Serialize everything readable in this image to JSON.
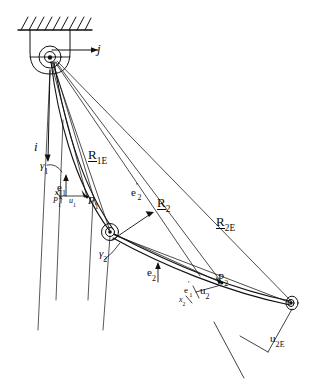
{
  "figure": {
    "type": "line-diagram",
    "width": 311,
    "height": 388,
    "background_color": "#ffffff",
    "stroke_color": "#111111"
  },
  "labels": {
    "j_vector": "j",
    "i_vector": "i",
    "gamma_1": {
      "symbol": "γ",
      "sub": "1"
    },
    "gamma_2": {
      "symbol": "γ",
      "sub": "2"
    },
    "e_1": {
      "symbol": "e",
      "sub": "1"
    },
    "e_2": {
      "symbol": "e",
      "sub": "2"
    },
    "e_1_prime": {
      "symbol": "e",
      "prime": "'",
      "sub": "1"
    },
    "e_2_prime": {
      "symbol": "e",
      "prime": "'",
      "sub": "2"
    },
    "x_1": {
      "symbol": "x",
      "sub": "1"
    },
    "x_2": {
      "symbol": "x",
      "sub": "2"
    },
    "p_1": {
      "symbol": "P",
      "sub": "1"
    },
    "p_2": {
      "symbol": "P",
      "sub": "2"
    },
    "u_1": {
      "symbol": "u",
      "sub": "1"
    },
    "u_2": {
      "symbol": "u",
      "sub": "2"
    },
    "u_2E": {
      "symbol": "u",
      "sub": "2E"
    },
    "R_1E": {
      "symbol": "R",
      "sub": "1E",
      "underlined": true
    },
    "R_2": {
      "symbol": "R",
      "sub": "2",
      "underlined": true
    },
    "R_2E": {
      "symbol": "R",
      "sub": "2E",
      "underlined": true
    }
  },
  "nodes": {
    "base_pivot": {
      "name": "base-hub",
      "x": 50,
      "y": 58
    },
    "mid_joint": {
      "name": "elbow-hub",
      "x": 110,
      "y": 232
    },
    "end_effector": {
      "name": "end-effector-hub",
      "x": 292,
      "y": 303
    },
    "point_p1": {
      "name": "point-p1",
      "x": 87,
      "y": 197
    },
    "point_p2": {
      "name": "point-p2",
      "x": 222,
      "y": 283
    }
  },
  "components": {
    "ceiling": "hatched-fixed-support",
    "bracket": "rounded-mounting-bracket",
    "link_1": "flexible-link-1",
    "link_2": "flexible-link-2"
  }
}
